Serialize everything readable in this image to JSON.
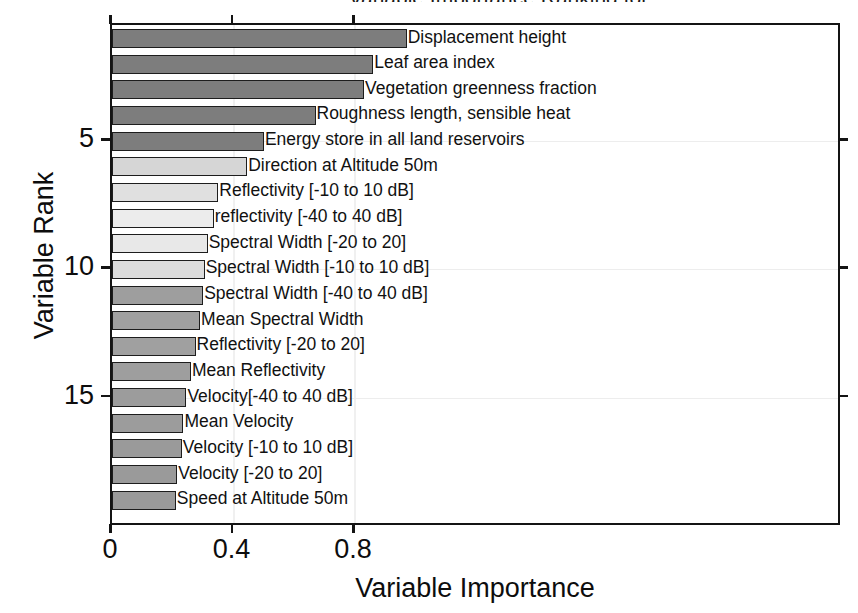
{
  "chart_data": {
    "type": "bar",
    "orientation": "horizontal",
    "title": "Variable Importance Ranking for ...",
    "xlabel": "Variable Importance",
    "ylabel": "Variable Rank",
    "xlim": [
      0,
      2.4
    ],
    "ylim": [
      19.5,
      0.5
    ],
    "xticks": [
      "0",
      "0.4",
      "0.8"
    ],
    "xtick_values": [
      0,
      0.4,
      0.8
    ],
    "yticks": [
      "5",
      "10",
      "15"
    ],
    "ytick_values": [
      5,
      10,
      15
    ],
    "grid": "light horizontal and vertical gridlines",
    "legend": "none",
    "categories": [
      "Displacement height",
      "Leaf area index",
      "Vegetation greenness fraction",
      "Roughness length, sensible heat",
      "Energy store in all land reservoirs",
      "Direction at Altitude 50m",
      "Reflectivity [-10 to 10 dB]",
      "reflectivity [-40 to 40 dB]",
      "Spectral Width [-20 to 20]",
      "Spectral Width [-10 to 10 dB]",
      "Spectral Width [-40 to 40 dB]",
      "Mean Spectral Width",
      "Reflectivity [-20 to 20]",
      "Mean Reflectivity",
      "Velocity[-40 to 40 dB]",
      "Mean Velocity",
      "Velocity [-10 to 10 dB]",
      "Velocity [-20 to 20]",
      "Speed at Altitude 50m"
    ],
    "values": [
      0.97,
      0.86,
      0.83,
      0.67,
      0.5,
      0.445,
      0.35,
      0.335,
      0.315,
      0.305,
      0.3,
      0.29,
      0.275,
      0.26,
      0.245,
      0.235,
      0.23,
      0.215,
      0.21
    ],
    "ranks": [
      1,
      2,
      3,
      4,
      5,
      6,
      7,
      8,
      9,
      10,
      11,
      12,
      13,
      14,
      15,
      16,
      17,
      18,
      19
    ],
    "bar_colors": [
      "#7d7d7d",
      "#7d7d7d",
      "#7d7d7d",
      "#7d7d7d",
      "#7d7d7d",
      "#d6d6d6",
      "#e0e0e0",
      "#ececec",
      "#e8e8e8",
      "#dcdcdc",
      "#9e9e9e",
      "#a0a0a0",
      "#a0a0a0",
      "#9e9e9e",
      "#9c9c9c",
      "#9c9c9c",
      "#9a9a9a",
      "#9a9a9a",
      "#9a9a9a"
    ],
    "colors": {
      "axis": "#141414",
      "bar_edge": "#1d1d1d",
      "grid": "#ededed",
      "background": "#ffffff",
      "text": "#0d0d0d"
    }
  }
}
